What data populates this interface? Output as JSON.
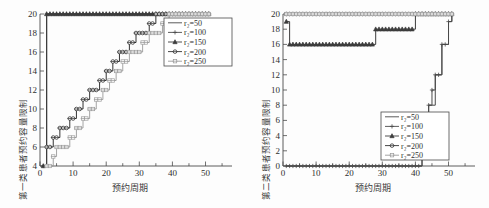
{
  "figure": {
    "panels": [
      {
        "id": "left",
        "ylabel": "第一类患者预约容量限制",
        "xlabel": "预约周期"
      },
      {
        "id": "right",
        "ylabel": "第二类患者预约容量限制",
        "xlabel": "预约周期"
      }
    ],
    "legend_var": "r",
    "legend_sub": "2"
  },
  "legend": {
    "items": [
      {
        "label": "r₂=50",
        "value": "50",
        "marker": "none",
        "color": "#4a4a4a"
      },
      {
        "label": "r₂=100",
        "value": "100",
        "marker": "plus",
        "color": "#4a4a4a"
      },
      {
        "label": "r₂=150",
        "value": "150",
        "marker": "triangle",
        "color": "#3c3c3c"
      },
      {
        "label": "r₂=200",
        "value": "200",
        "marker": "circle",
        "color": "#333333"
      },
      {
        "label": "r₂=250",
        "value": "250",
        "marker": "square",
        "color": "#9a9a9a"
      }
    ]
  },
  "chart_data": [
    {
      "type": "line",
      "id": "left-panel",
      "title": "",
      "xlabel": "预约周期",
      "ylabel": "第一类患者预约容量限制",
      "xlim": [
        0,
        58
      ],
      "ylim": [
        4,
        20
      ],
      "xticks": [
        0,
        10,
        20,
        30,
        40,
        50
      ],
      "yticks": [
        4,
        6,
        8,
        10,
        12,
        14,
        16,
        18,
        20
      ],
      "grid": false,
      "legend_position": "upper right",
      "series": [
        {
          "name": "r₂=50",
          "marker": "none",
          "color": "#4a4a4a",
          "x": [
            1,
            2,
            3,
            10,
            20,
            30,
            40,
            51
          ],
          "y": [
            4,
            20,
            20,
            20,
            20,
            20,
            20,
            20
          ]
        },
        {
          "name": "r₂=100",
          "marker": "plus",
          "color": "#4a4a4a",
          "x": [
            1,
            2,
            3,
            10,
            20,
            30,
            40,
            51
          ],
          "y": [
            4,
            20,
            20,
            20,
            20,
            20,
            20,
            20
          ]
        },
        {
          "name": "r₂=150",
          "marker": "triangle",
          "color": "#3c3c3c",
          "x": [
            1,
            2,
            3,
            10,
            20,
            30,
            40,
            51
          ],
          "y": [
            4,
            20,
            20,
            20,
            20,
            20,
            20,
            20
          ]
        },
        {
          "name": "r₂=200",
          "marker": "circle",
          "color": "#333333",
          "x": [
            2,
            3,
            4,
            6,
            7,
            9,
            11,
            13,
            15,
            16,
            18,
            20,
            22,
            24,
            25,
            27,
            29,
            31,
            33,
            35,
            37,
            51
          ],
          "y": [
            6,
            6,
            7,
            8,
            8,
            9,
            10,
            11,
            12,
            12,
            13,
            14,
            15,
            16,
            16,
            17,
            18,
            18,
            19,
            20,
            20,
            20
          ]
        },
        {
          "name": "r₂=250",
          "marker": "square",
          "color": "#9a9a9a",
          "x": [
            2,
            4,
            5,
            7,
            9,
            11,
            13,
            15,
            17,
            19,
            21,
            23,
            25,
            27,
            29,
            31,
            33,
            35,
            37,
            39,
            41,
            51
          ],
          "y": [
            4,
            5,
            6,
            6,
            7,
            8,
            9,
            10,
            11,
            12,
            13,
            14,
            15,
            16,
            16,
            17,
            18,
            18,
            19,
            20,
            20,
            20
          ]
        }
      ]
    },
    {
      "type": "line",
      "id": "right-panel",
      "title": "",
      "xlabel": "预约周期",
      "ylabel": "第二类患者预约容量限制",
      "xlim": [
        0,
        58
      ],
      "ylim": [
        0,
        20
      ],
      "xticks": [
        0,
        10,
        20,
        30,
        40,
        50
      ],
      "yticks": [
        0,
        2,
        4,
        6,
        8,
        10,
        12,
        14,
        16,
        18,
        20
      ],
      "grid": false,
      "legend_position": "lower right",
      "series": [
        {
          "name": "r₂=50",
          "marker": "none",
          "color": "#4a4a4a",
          "x": [
            1,
            5,
            10,
            20,
            30,
            39,
            40,
            42,
            44,
            46,
            48,
            50,
            51
          ],
          "y": [
            0,
            0,
            0,
            0,
            0,
            0,
            0,
            4,
            8,
            12,
            16,
            19,
            20
          ]
        },
        {
          "name": "r₂=100",
          "marker": "plus",
          "color": "#4a4a4a",
          "x": [
            1,
            5,
            10,
            20,
            30,
            39,
            40,
            42,
            44,
            45,
            46,
            48,
            50,
            51
          ],
          "y": [
            0,
            0,
            0,
            0,
            0,
            0,
            0,
            4,
            8,
            10,
            12,
            16,
            19,
            20
          ]
        },
        {
          "name": "r₂=150",
          "marker": "triangle",
          "color": "#3c3c3c",
          "x": [
            1,
            2,
            10,
            20,
            27,
            28,
            35,
            39,
            40,
            51
          ],
          "y": [
            19,
            16,
            16,
            16,
            16,
            18,
            18,
            18,
            20,
            20
          ]
        },
        {
          "name": "r₂=200",
          "marker": "circle",
          "color": "#333333",
          "x": [
            1,
            5,
            10,
            20,
            30,
            40,
            51
          ],
          "y": [
            20,
            20,
            20,
            20,
            20,
            20,
            20
          ]
        },
        {
          "name": "r₂=250",
          "marker": "square",
          "color": "#9a9a9a",
          "x": [
            1,
            5,
            10,
            20,
            30,
            40,
            51
          ],
          "y": [
            20,
            20,
            20,
            20,
            20,
            20,
            20
          ]
        }
      ]
    }
  ]
}
